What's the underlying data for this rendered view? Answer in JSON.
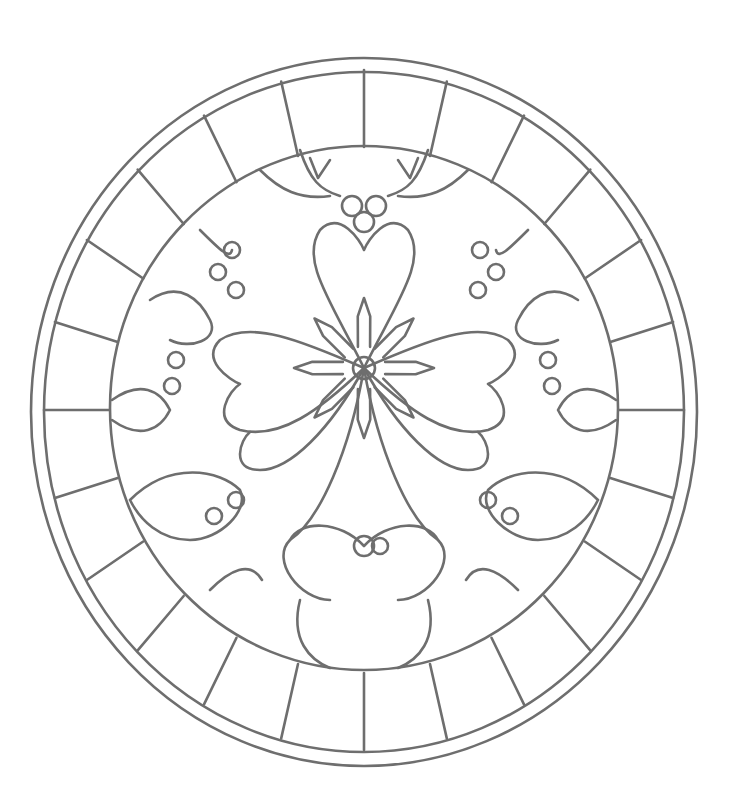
{
  "image": {
    "subject": "Round stained-glass window coloring page with poinsettia and holly motif",
    "width": 741,
    "height": 809,
    "background": "#ffffff",
    "line_color": "#6e6e6e",
    "center": [
      364,
      408
    ],
    "outer_ring_rx": [
      332,
      333
    ],
    "outer_ring_ry": [
      353,
      354
    ],
    "border_segments": 24,
    "inner_medallion_rx": 254,
    "inner_medallion_ry": 262,
    "central_rosette_radius": 11,
    "elements": [
      "outer double ring",
      "segmented border band",
      "inner medallion",
      "central poinsettia star",
      "holly berry clusters",
      "holly leaves",
      "web-like lead lines"
    ]
  }
}
